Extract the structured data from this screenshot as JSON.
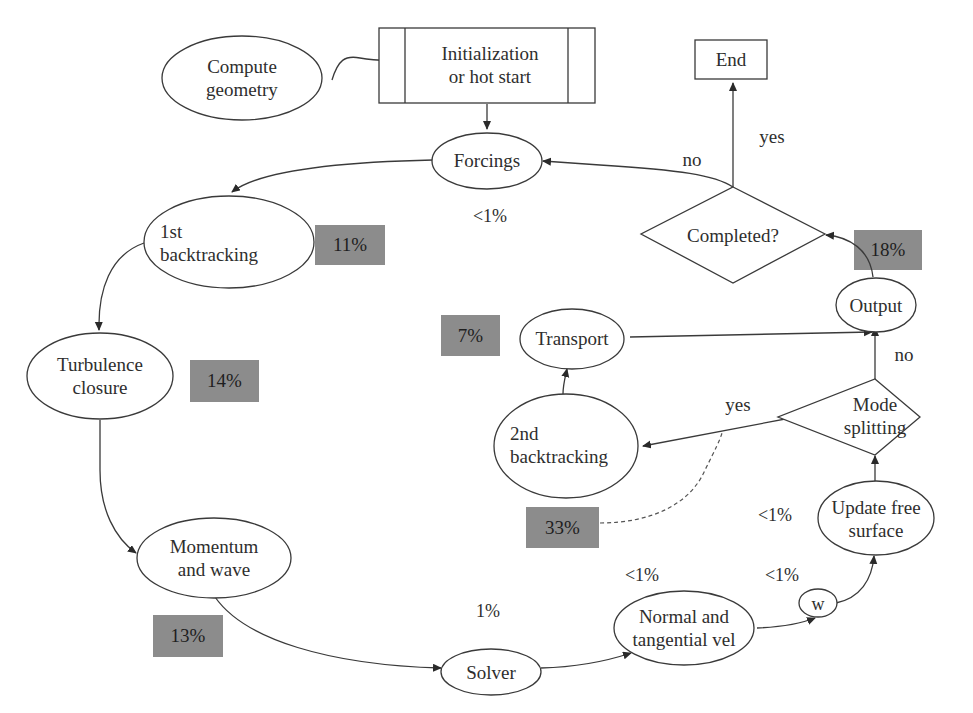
{
  "nodes": {
    "compute_geometry": {
      "line1": "Compute",
      "line2": "geometry"
    },
    "initialization": {
      "line1": "Initialization",
      "line2": "or hot start"
    },
    "end": {
      "label": "End"
    },
    "forcings": {
      "label": "Forcings"
    },
    "first_backtracking": {
      "line1": "1st",
      "line2": "backtracking"
    },
    "turbulence_closure": {
      "line1": "Turbulence",
      "line2": "closure"
    },
    "momentum_wave": {
      "line1": "Momentum",
      "line2": "and wave"
    },
    "solver": {
      "label": "Solver"
    },
    "normal_tangential": {
      "line1": "Normal and",
      "line2": "tangential vel"
    },
    "w": {
      "label": "w"
    },
    "update_free_surface": {
      "line1": "Update free",
      "line2": "surface"
    },
    "mode_splitting": {
      "line1": "Mode",
      "line2": "splitting"
    },
    "second_backtracking": {
      "line1": "2nd",
      "line2": "backtracking"
    },
    "transport": {
      "label": "Transport"
    },
    "output": {
      "label": "Output"
    },
    "completed": {
      "label": "Completed?"
    }
  },
  "edge_labels": {
    "completed_no": "no",
    "completed_yes": "yes",
    "mode_yes": "yes",
    "mode_no": "no"
  },
  "percentages": {
    "first_backtracking": "11%",
    "turbulence_closure": "14%",
    "momentum_wave": "13%",
    "transport": "7%",
    "second_backtracking": "33%",
    "output": "18%",
    "forcings": "<1%",
    "solver": "1%",
    "normal_tangential": "<1%",
    "w": "<1%",
    "update_free_surface": "<1%"
  },
  "colors": {
    "badge_fill": "#8c8c8c",
    "stroke": "#3a3a3a",
    "background": "#ffffff"
  }
}
